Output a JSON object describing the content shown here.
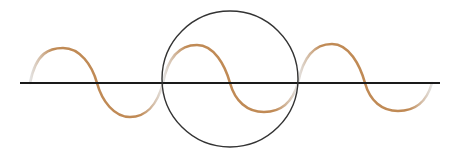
{
  "diagram": {
    "colors": {
      "background": "#ffffff",
      "axis": "#1a1a1a",
      "circle": "#333333",
      "wave": "#c08a55",
      "wave_fade": "#d8d8d8"
    },
    "axis": {
      "x1": 20,
      "x2": 440,
      "y": 83
    },
    "circle": {
      "cx": 230,
      "cy": 83,
      "r": 68
    },
    "wave": {
      "period_px": 135,
      "amplitude_px": 35,
      "zero_crossings_x": [
        30,
        97,
        163,
        230,
        298,
        365,
        432
      ]
    }
  }
}
